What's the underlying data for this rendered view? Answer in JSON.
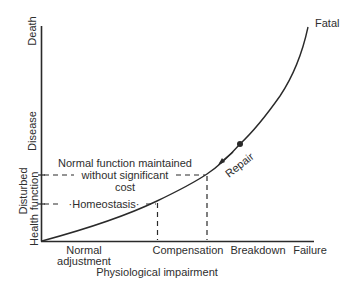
{
  "diagram": {
    "y_axis": {
      "labels": {
        "death": "Death",
        "disease": "Disease",
        "disturbed": "Disturbed",
        "function": "function",
        "health": "Health"
      }
    },
    "x_axis": {
      "title": "Physiological impairment",
      "labels": {
        "normal_line1": "Normal",
        "normal_line2": "adjustment",
        "compensation": "Compensation",
        "breakdown": "Breakdown",
        "failure": "Failure"
      }
    },
    "annotations": {
      "fatal": "Fatal",
      "repair": "Repair",
      "normal_function_line1": "Normal function maintained",
      "normal_function_line2": "without significant",
      "normal_function_line3": "cost",
      "homeostasis": "·Homeostasis·"
    },
    "colors": {
      "ink": "#2a2a2a",
      "background": "#ffffff"
    }
  }
}
